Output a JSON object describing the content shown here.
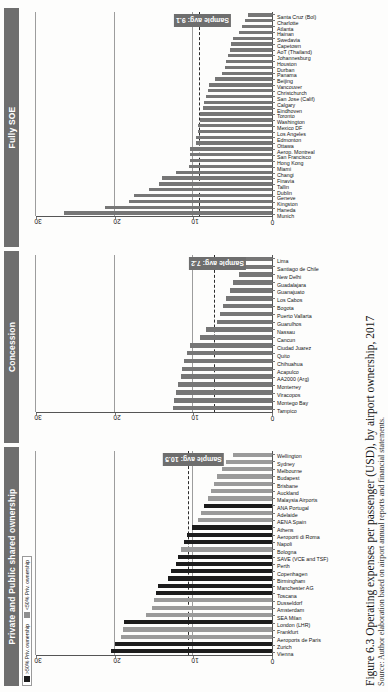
{
  "figure": {
    "caption": "Figure 6.3  Operating expenses per passenger (USD), by airport ownership, 2017",
    "caption_sub": "Source: Author elaboration based on airport annual reports and financial statements."
  },
  "legend": {
    "items": [
      {
        "label": ">50% Priv. ownership",
        "color": "#1c1c1c",
        "swatch": "sw-dark"
      },
      {
        "label": "<50% Priv. ownership",
        "color": "#8f8f8f",
        "swatch": "sw-grey"
      }
    ]
  },
  "axis": {
    "ticks": [
      "0",
      "10",
      "20",
      "30"
    ],
    "min": 0,
    "max": 30,
    "gridlines": [
      10,
      20,
      30
    ]
  },
  "chart_data": [
    {
      "type": "bar",
      "title": "Private and Public shared ownership",
      "panel_id": "private-public-shared",
      "xlabel": "",
      "ylabel": "Operating expenses per passenger (USD)",
      "ylim": [
        0,
        30
      ],
      "grid": true,
      "avg_label": "Sample avg: 10.5",
      "avg_value": 10.5,
      "legend_position": "top-left",
      "categories": [
        "Vienna",
        "Zurich",
        "Aeroports de Paris",
        "Frankfurt",
        "London (LHR)",
        "SEA Milan",
        "Amsterdam",
        "Dusseldorf",
        "Toscana",
        "Manchester AG",
        "Birmingham",
        "Copenhagen",
        "Perth",
        "SAVE (VCE and TSF)",
        "Bologna",
        "Napoli",
        "Aeroporti di Roma",
        "Athens",
        "AENA Spain",
        "Adelaide",
        "ANA Portugal",
        "Malaysia Airports",
        "Auckland",
        "Brisbane",
        "Budapest",
        "Melbourne",
        "Sydney",
        "Wellington"
      ],
      "values": [
        20.5,
        20.0,
        19.2,
        19.0,
        18.8,
        16.0,
        15.2,
        15.0,
        14.8,
        14.5,
        13.2,
        12.8,
        12.2,
        12.0,
        11.6,
        11.2,
        10.8,
        10.2,
        9.4,
        9.0,
        8.6,
        8.2,
        7.8,
        7.4,
        7.0,
        6.4,
        5.8,
        5.0
      ],
      "bar_shades": [
        "dark",
        "dark",
        "grey",
        "grey",
        "dark",
        "grey",
        "grey",
        "grey",
        "dark",
        "dark",
        "dark",
        "dark",
        "dark",
        "dark",
        "grey",
        "dark",
        "dark",
        "dark",
        "grey",
        "grey",
        "dark",
        "grey",
        "grey",
        "grey",
        "grey",
        "grey",
        "grey",
        "grey"
      ]
    },
    {
      "type": "bar",
      "title": "Concession",
      "panel_id": "concession",
      "xlabel": "",
      "ylabel": "Operating expenses per passenger (USD)",
      "ylim": [
        0,
        30
      ],
      "grid": true,
      "avg_label": "Sample avg: 7.2",
      "avg_value": 7.2,
      "legend_position": "none",
      "categories": [
        "Tampico",
        "Montego Bay",
        "Viracopos",
        "Monterrey",
        "AA2000 (Arg)",
        "Acapulco",
        "Chihuahua",
        "Quito",
        "Ciudad Juarez",
        "Cancun",
        "Nassau",
        "Guarulhos",
        "Puerto Vallarta",
        "Bogota",
        "Los Cabos",
        "Guanajuato",
        "Guadalajara",
        "New Delhi",
        "Santiago de Chile",
        "Lima"
      ],
      "values": [
        12.6,
        12.4,
        12.2,
        12.0,
        11.6,
        11.4,
        11.2,
        10.8,
        10.4,
        9.2,
        8.4,
        7.0,
        6.6,
        6.2,
        5.8,
        5.4,
        5.0,
        4.2,
        4.0,
        3.4
      ],
      "bar_shades": [
        "plain",
        "plain",
        "plain",
        "plain",
        "plain",
        "plain",
        "plain",
        "plain",
        "plain",
        "plain",
        "plain",
        "plain",
        "plain",
        "plain",
        "plain",
        "plain",
        "plain",
        "plain",
        "plain",
        "plain"
      ]
    },
    {
      "type": "bar",
      "title": "Fully SOE",
      "panel_id": "fully-soe",
      "xlabel": "",
      "ylabel": "Operating expenses per passenger (USD)",
      "ylim": [
        0,
        30
      ],
      "grid": true,
      "avg_label": "Sample avg: 9.1",
      "avg_value": 9.1,
      "legend_position": "none",
      "categories": [
        "Munich",
        "Haneda",
        "Kingston",
        "Geneve",
        "Dublin",
        "Tallin",
        "Finavia",
        "Changi",
        "Miami",
        "Hong Kong",
        "San Francisco",
        "Aerop. Montreal",
        "Ottawa",
        "Edmonton",
        "Los Angeles",
        "Mexico DF",
        "Washington",
        "Toronto",
        "Eindhoven",
        "Calgary",
        "San Jose (Calif)",
        "Christchurch",
        "Vancouver",
        "Beijing",
        "Panama",
        "Durban",
        "Houston",
        "Johannesburg",
        "AoT (Thailand)",
        "Capetown",
        "Swedavia",
        "Hainan",
        "Atlanta",
        "Charlotte",
        "Santa Cruz (Bol)"
      ],
      "values": [
        26.5,
        21.2,
        18.2,
        17.6,
        15.6,
        14.4,
        14.0,
        12.2,
        10.6,
        10.4,
        10.4,
        10.4,
        9.6,
        9.6,
        9.4,
        9.4,
        9.2,
        9.2,
        8.8,
        8.6,
        8.4,
        8.2,
        8.0,
        7.2,
        6.4,
        6.0,
        5.8,
        5.6,
        5.4,
        5.2,
        5.0,
        4.2,
        3.8,
        3.4,
        3.0
      ],
      "bar_shades": [
        "plain",
        "plain",
        "plain",
        "plain",
        "plain",
        "plain",
        "plain",
        "plain",
        "plain",
        "plain",
        "plain",
        "plain",
        "plain",
        "plain",
        "plain",
        "plain",
        "plain",
        "plain",
        "plain",
        "plain",
        "plain",
        "plain",
        "plain",
        "plain",
        "plain",
        "plain",
        "plain",
        "plain",
        "plain",
        "plain",
        "plain",
        "plain",
        "plain",
        "plain",
        "plain"
      ]
    }
  ]
}
